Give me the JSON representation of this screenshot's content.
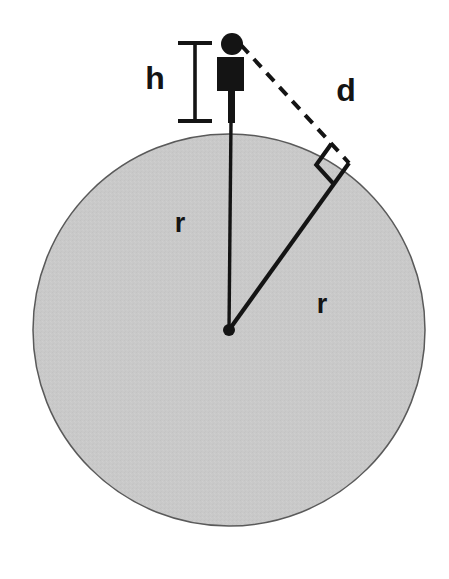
{
  "diagram": {
    "background_color": "#ffffff",
    "labels": {
      "height": "h",
      "distance": "d",
      "radius_vertical": "r",
      "radius_diagonal": "r"
    },
    "colors": {
      "planet_fill": "#c9c9c9",
      "planet_stroke": "#5a5a5a",
      "line": "#141414",
      "figure": "#141414",
      "label": "#141414"
    },
    "geometry": {
      "planet": {
        "cx": 229,
        "cy": 330,
        "r": 196
      },
      "center_dot": {
        "cx": 229,
        "cy": 330,
        "r": 6
      },
      "observer": {
        "head": {
          "cx": 232,
          "cy": 44,
          "r": 11
        },
        "body": {
          "x": 217,
          "y": 57,
          "width": 27,
          "height": 34
        },
        "leg": {
          "x": 228,
          "y": 90,
          "width": 7,
          "height": 33
        }
      },
      "height_bar": {
        "x": 195,
        "y_top": 42,
        "y_bottom": 122,
        "cap_half_width": 17
      },
      "sight_line": {
        "x1": 241,
        "y1": 45,
        "x2": 349,
        "y2": 163
      },
      "radius_vertical": {
        "x1": 231,
        "y1": 122,
        "x2": 229,
        "y2": 330
      },
      "radius_diagonal": {
        "x1": 229,
        "y1": 330,
        "x2": 349,
        "y2": 163
      },
      "right_angle": {
        "x": 349,
        "y": 163,
        "size": 26
      }
    },
    "label_positions": {
      "height": {
        "x": 155,
        "y": 89
      },
      "distance": {
        "x": 346,
        "y": 101
      },
      "radius_vertical": {
        "x": 180,
        "y": 232
      },
      "radius_diagonal": {
        "x": 322,
        "y": 313
      }
    },
    "label_font_size": {
      "height": 32,
      "distance": 32,
      "radius_vertical": 27,
      "radius_diagonal": 27
    }
  }
}
